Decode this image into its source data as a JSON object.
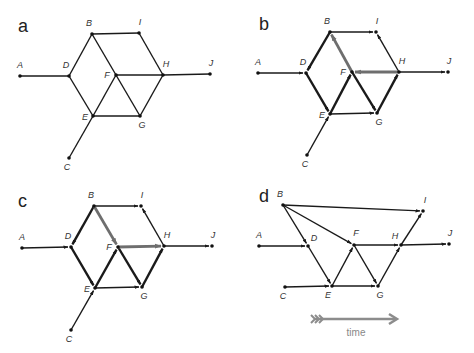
{
  "colors": {
    "edge": "#1a1a1a",
    "highlight": "#6e6e6e",
    "time_arrow": "#8c8c8c",
    "node": "#111111"
  },
  "panels": [
    {
      "letter": "a",
      "letter_pos": [
        18,
        32
      ],
      "nodes": {
        "A": [
          20,
          76
        ],
        "B": [
          92,
          34
        ],
        "C": [
          69,
          158
        ],
        "D": [
          69,
          76
        ],
        "E": [
          93,
          116
        ],
        "F": [
          116,
          75
        ],
        "G": [
          140,
          116
        ],
        "H": [
          163,
          75
        ],
        "I": [
          139,
          33
        ],
        "J": [
          210,
          74
        ]
      },
      "label_offsets": {
        "A": [
          0,
          -8
        ],
        "B": [
          -3,
          -8
        ],
        "C": [
          -2,
          12
        ],
        "D": [
          -3,
          -8
        ],
        "E": [
          -8,
          4
        ],
        "F": [
          -9,
          3
        ],
        "G": [
          2,
          12
        ],
        "H": [
          3,
          -8
        ],
        "I": [
          1,
          -8
        ],
        "J": [
          1,
          -8
        ]
      },
      "edges": [
        {
          "from": "A",
          "to": "D",
          "directed": false,
          "style": "normal"
        },
        {
          "from": "B",
          "to": "I",
          "directed": false,
          "style": "normal"
        },
        {
          "from": "B",
          "to": "D",
          "directed": false,
          "style": "normal"
        },
        {
          "from": "B",
          "to": "G",
          "directed": false,
          "style": "normal"
        },
        {
          "from": "D",
          "to": "E",
          "directed": false,
          "style": "normal"
        },
        {
          "from": "E",
          "to": "F",
          "directed": false,
          "style": "normal"
        },
        {
          "from": "E",
          "to": "G",
          "directed": false,
          "style": "normal"
        },
        {
          "from": "F",
          "to": "H",
          "directed": false,
          "style": "normal"
        },
        {
          "from": "G",
          "to": "H",
          "directed": false,
          "style": "normal"
        },
        {
          "from": "H",
          "to": "I",
          "directed": false,
          "style": "normal"
        },
        {
          "from": "H",
          "to": "J",
          "directed": false,
          "style": "normal"
        },
        {
          "from": "C",
          "to": "E",
          "directed": false,
          "style": "normal"
        }
      ]
    },
    {
      "letter": "b",
      "letter_pos": [
        259,
        30
      ],
      "nodes": {
        "A": [
          258,
          73
        ],
        "B": [
          330,
          32
        ],
        "C": [
          307,
          155
        ],
        "D": [
          306,
          73
        ],
        "E": [
          330,
          114
        ],
        "F": [
          352,
          72
        ],
        "G": [
          377,
          113
        ],
        "H": [
          399,
          72
        ],
        "I": [
          376,
          32
        ],
        "J": [
          448,
          72
        ]
      },
      "label_offsets": {
        "A": [
          0,
          -8
        ],
        "B": [
          -3,
          -8
        ],
        "C": [
          -2,
          12
        ],
        "D": [
          -3,
          -8
        ],
        "E": [
          -8,
          4
        ],
        "F": [
          -9,
          3
        ],
        "G": [
          2,
          12
        ],
        "H": [
          3,
          -8
        ],
        "I": [
          1,
          -8
        ],
        "J": [
          1,
          -8
        ]
      },
      "edges": [
        {
          "from": "A",
          "to": "D",
          "directed": true,
          "style": "normal"
        },
        {
          "from": "B",
          "to": "I",
          "directed": true,
          "style": "normal"
        },
        {
          "from": "B",
          "to": "D",
          "directed": true,
          "style": "thick"
        },
        {
          "from": "F",
          "to": "B",
          "directed": true,
          "style": "highlight"
        },
        {
          "from": "D",
          "to": "E",
          "directed": true,
          "style": "thick"
        },
        {
          "from": "E",
          "to": "F",
          "directed": true,
          "style": "thick"
        },
        {
          "from": "F",
          "to": "G",
          "directed": true,
          "style": "thick"
        },
        {
          "from": "E",
          "to": "G",
          "directed": true,
          "style": "normal"
        },
        {
          "from": "G",
          "to": "H",
          "directed": true,
          "style": "thick"
        },
        {
          "from": "H",
          "to": "I",
          "directed": true,
          "style": "normal"
        },
        {
          "from": "H",
          "to": "F",
          "directed": true,
          "style": "highlight"
        },
        {
          "from": "H",
          "to": "J",
          "directed": true,
          "style": "normal"
        },
        {
          "from": "C",
          "to": "E",
          "directed": true,
          "style": "normal"
        }
      ]
    },
    {
      "letter": "c",
      "letter_pos": [
        18,
        207
      ],
      "nodes": {
        "A": [
          22,
          248
        ],
        "B": [
          94,
          206
        ],
        "C": [
          71,
          330
        ],
        "D": [
          71,
          247
        ],
        "E": [
          95,
          288
        ],
        "F": [
          118,
          247
        ],
        "G": [
          142,
          287
        ],
        "H": [
          164,
          246
        ],
        "I": [
          141,
          206
        ],
        "J": [
          212,
          246
        ]
      },
      "label_offsets": {
        "A": [
          0,
          -8
        ],
        "B": [
          -3,
          -8
        ],
        "C": [
          -2,
          12
        ],
        "D": [
          -3,
          -8
        ],
        "E": [
          -8,
          4
        ],
        "F": [
          -9,
          3
        ],
        "G": [
          2,
          12
        ],
        "H": [
          3,
          -8
        ],
        "I": [
          1,
          -8
        ],
        "J": [
          1,
          -8
        ]
      },
      "edges": [
        {
          "from": "A",
          "to": "D",
          "directed": true,
          "style": "normal"
        },
        {
          "from": "B",
          "to": "I",
          "directed": true,
          "style": "normal"
        },
        {
          "from": "B",
          "to": "D",
          "directed": true,
          "style": "thick"
        },
        {
          "from": "B",
          "to": "F",
          "directed": true,
          "style": "highlight"
        },
        {
          "from": "D",
          "to": "E",
          "directed": true,
          "style": "thick"
        },
        {
          "from": "E",
          "to": "F",
          "directed": true,
          "style": "thick"
        },
        {
          "from": "F",
          "to": "G",
          "directed": true,
          "style": "thick"
        },
        {
          "from": "E",
          "to": "G",
          "directed": true,
          "style": "normal"
        },
        {
          "from": "G",
          "to": "H",
          "directed": true,
          "style": "thick"
        },
        {
          "from": "H",
          "to": "I",
          "directed": true,
          "style": "normal"
        },
        {
          "from": "F",
          "to": "H",
          "directed": true,
          "style": "highlight"
        },
        {
          "from": "H",
          "to": "J",
          "directed": true,
          "style": "normal"
        },
        {
          "from": "C",
          "to": "E",
          "directed": true,
          "style": "normal"
        }
      ]
    },
    {
      "letter": "d",
      "letter_pos": [
        259,
        202
      ],
      "nodes": {
        "A": [
          259,
          246
        ],
        "B": [
          283,
          205
        ],
        "C": [
          285,
          287
        ],
        "D": [
          308,
          246
        ],
        "E": [
          332,
          286
        ],
        "F": [
          354,
          245
        ],
        "G": [
          378,
          286
        ],
        "H": [
          401,
          245
        ],
        "I": [
          423,
          211
        ],
        "J": [
          449,
          244
        ]
      },
      "label_offsets": {
        "A": [
          0,
          -8
        ],
        "B": [
          -3,
          -8
        ],
        "C": [
          -2,
          12
        ],
        "D": [
          6,
          -5
        ],
        "E": [
          -4,
          12
        ],
        "F": [
          2,
          -9
        ],
        "G": [
          2,
          12
        ],
        "H": [
          -6,
          -6
        ],
        "I": [
          2,
          -8
        ],
        "J": [
          1,
          -8
        ]
      },
      "edges": [
        {
          "from": "A",
          "to": "D",
          "directed": true,
          "style": "normal"
        },
        {
          "from": "B",
          "to": "I",
          "directed": true,
          "style": "normal"
        },
        {
          "from": "B",
          "to": "D",
          "directed": true,
          "style": "normal"
        },
        {
          "from": "B",
          "to": "F",
          "directed": true,
          "style": "normal"
        },
        {
          "from": "D",
          "to": "E",
          "directed": true,
          "style": "normal"
        },
        {
          "from": "C",
          "to": "E",
          "directed": true,
          "style": "normal"
        },
        {
          "from": "E",
          "to": "F",
          "directed": true,
          "style": "normal"
        },
        {
          "from": "E",
          "to": "G",
          "directed": true,
          "style": "normal"
        },
        {
          "from": "F",
          "to": "G",
          "directed": true,
          "style": "normal"
        },
        {
          "from": "F",
          "to": "H",
          "directed": true,
          "style": "normal"
        },
        {
          "from": "G",
          "to": "H",
          "directed": true,
          "style": "normal"
        },
        {
          "from": "H",
          "to": "I",
          "directed": true,
          "style": "normal"
        },
        {
          "from": "H",
          "to": "J",
          "directed": true,
          "style": "normal"
        }
      ]
    }
  ],
  "time_arrow": {
    "label": "time",
    "x1": 311,
    "x2": 397,
    "y": 319,
    "label_pos": [
      356,
      336
    ]
  }
}
